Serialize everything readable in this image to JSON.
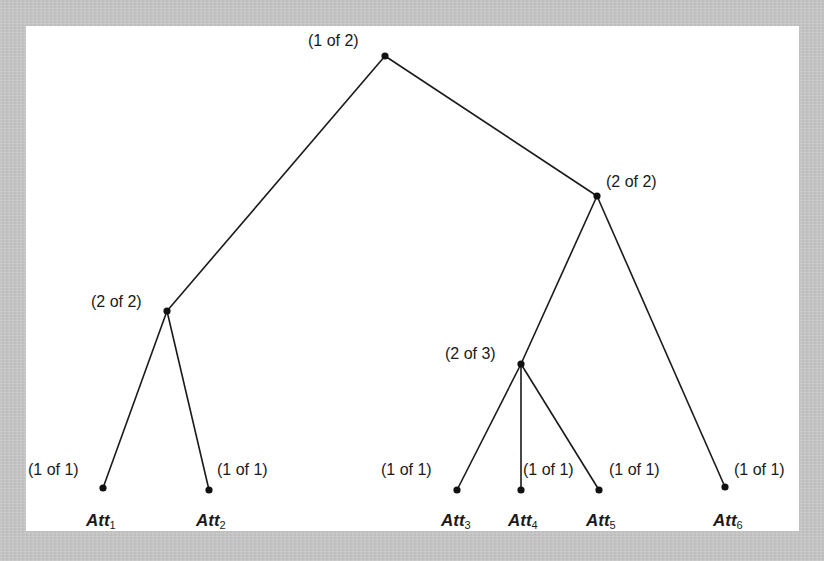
{
  "diagram": {
    "type": "tree",
    "background_color": "#c8c8c8",
    "panel_color": "#ffffff",
    "line_color": "#1a1a1a",
    "nodes": {
      "root": {
        "label": "(1 of 2)",
        "x": 385,
        "y": 56
      },
      "left_mid": {
        "label": "(2 of 2)",
        "x": 167,
        "y": 311
      },
      "right_mid": {
        "label": "(2 of 2)",
        "x": 597,
        "y": 196
      },
      "mid_three": {
        "label": "(2 of 3)",
        "x": 521,
        "y": 364
      }
    },
    "leaves": [
      {
        "id": "att1",
        "threshold": "(1 of 1)",
        "name": "Att",
        "sub": "1",
        "x": 103,
        "y": 488
      },
      {
        "id": "att2",
        "threshold": "(1 of 1)",
        "name": "Att",
        "sub": "2",
        "x": 209,
        "y": 490
      },
      {
        "id": "att3",
        "threshold": "(1 of 1)",
        "name": "Att",
        "sub": "3",
        "x": 457,
        "y": 490
      },
      {
        "id": "att4",
        "threshold": "(1 of 1)",
        "name": "Att",
        "sub": "4",
        "x": 521,
        "y": 490
      },
      {
        "id": "att5",
        "threshold": "(1 of 1)",
        "name": "Att",
        "sub": "5",
        "x": 599,
        "y": 490
      },
      {
        "id": "att6",
        "threshold": "(1 of 1)",
        "name": "Att",
        "sub": "6",
        "x": 725,
        "y": 487
      }
    ],
    "edges": [
      [
        "root",
        "left_mid"
      ],
      [
        "root",
        "right_mid"
      ],
      [
        "left_mid",
        "att1"
      ],
      [
        "left_mid",
        "att2"
      ],
      [
        "right_mid",
        "mid_three"
      ],
      [
        "right_mid",
        "att6"
      ],
      [
        "mid_three",
        "att3"
      ],
      [
        "mid_three",
        "att4"
      ],
      [
        "mid_three",
        "att5"
      ]
    ]
  }
}
